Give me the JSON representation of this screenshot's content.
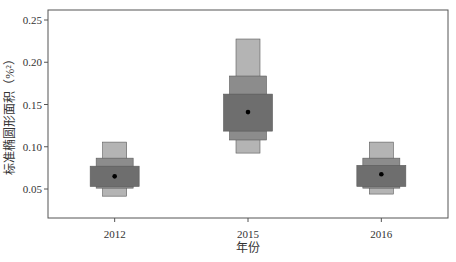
{
  "chart_data": {
    "type": "boxen",
    "title": "",
    "xlabel": "年份",
    "ylabel": "标准椭圆形面积（%²）",
    "categories": [
      "2012",
      "2015",
      "2016"
    ],
    "ylim": [
      0.015,
      0.262
    ],
    "yticks": [
      0.05,
      0.1,
      0.15,
      0.2,
      0.25
    ],
    "ytick_labels": [
      "0.05",
      "0.10",
      "0.15",
      "0.20",
      "0.25"
    ],
    "grid": false,
    "legend": null,
    "series": [
      {
        "name": "2012",
        "median": 0.065,
        "levels": [
          {
            "low": 0.053,
            "high": 0.077
          },
          {
            "low": 0.051,
            "high": 0.0865
          },
          {
            "low": 0.0415,
            "high": 0.1055
          }
        ]
      },
      {
        "name": "2015",
        "median": 0.141,
        "levels": [
          {
            "low": 0.1185,
            "high": 0.1623
          },
          {
            "low": 0.108,
            "high": 0.1837
          },
          {
            "low": 0.0925,
            "high": 0.2275
          }
        ]
      },
      {
        "name": "2016",
        "median": 0.0675,
        "levels": [
          {
            "low": 0.053,
            "high": 0.078
          },
          {
            "low": 0.051,
            "high": 0.0865
          },
          {
            "low": 0.044,
            "high": 0.1055
          }
        ]
      }
    ],
    "colors": {
      "level_inner": "#6e6e6e",
      "level_mid": "#8c8c8c",
      "level_outer": "#b4b4b4",
      "median_point": "#000000",
      "frame": "#555555"
    }
  }
}
